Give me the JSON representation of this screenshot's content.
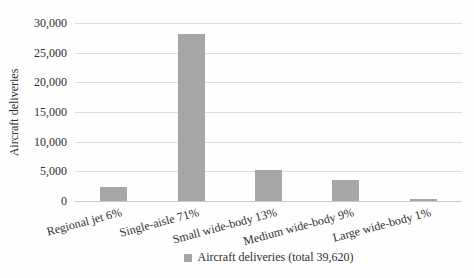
{
  "chart_data": {
    "type": "bar",
    "title": "",
    "xlabel": "",
    "ylabel": "Aircraft deliveries",
    "categories": [
      "Regional jet 6%",
      "Single-aisle 71%",
      "Small wide-body 13%",
      "Medium wide-body 9%",
      "Large wide-body 1%"
    ],
    "values": [
      2377,
      28130,
      5151,
      3566,
      396
    ],
    "total_label": "39,620",
    "ylim": [
      0,
      30000
    ],
    "ytick_step": 5000,
    "ytick_labels": [
      "0",
      "5,000",
      "10,000",
      "15,000",
      "20,000",
      "25,000",
      "30,000"
    ],
    "grid": true,
    "legend": {
      "position": "bottom",
      "label": "Aircraft deliveries (total 39,620)"
    },
    "colors": {
      "bar": "#a6a6a6",
      "gridline": "#dcdcdc",
      "axis_line": "#c9c9c9",
      "text": "#2e2e2e",
      "background": "#fefefe"
    }
  }
}
